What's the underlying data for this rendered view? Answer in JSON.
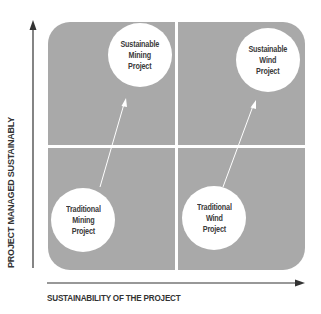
{
  "diagram": {
    "type": "2x2 quadrant matrix",
    "axes": {
      "y_label": "PROJECT MANAGED SUSTAINABLY",
      "x_label": "SUSTAINABILITY OF THE PROJECT"
    },
    "nodes": {
      "sustainable_mining": "Sustainable\nMining\nProject",
      "sustainable_wind": "Sustainable\nWind\nProject",
      "traditional_mining": "Traditional\nMining\nProject",
      "traditional_wind": "Traditional\nWind\nProject"
    },
    "edges": [
      {
        "from": "Traditional Mining Project",
        "to": "Sustainable Mining Project"
      },
      {
        "from": "Traditional Wind Project",
        "to": "Sustainable Wind Project"
      }
    ],
    "colors": {
      "panel": "#a9a9a9",
      "divider": "#ffffff",
      "circle": "#ffffff",
      "text": "#333333",
      "axis": "#333333"
    }
  }
}
